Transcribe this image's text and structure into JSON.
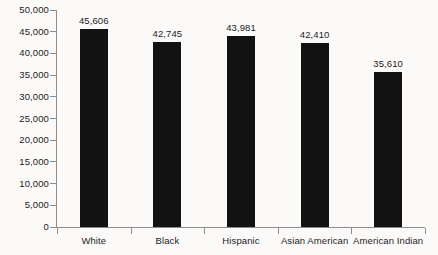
{
  "chart_data": {
    "type": "bar",
    "title": "",
    "subtitle": "",
    "xlabel": "",
    "ylabel": "",
    "categories": [
      "White",
      "Black",
      "Hispanic",
      "Asian American",
      "American Indian"
    ],
    "values": [
      45606,
      42745,
      43981,
      42410,
      35610
    ],
    "value_labels": [
      "45,606",
      "42,745",
      "43,981",
      "42,410",
      "35,610"
    ],
    "ylim": [
      0,
      50000
    ],
    "ytick_values": [
      0,
      5000,
      10000,
      15000,
      20000,
      25000,
      30000,
      35000,
      40000,
      45000,
      50000
    ],
    "ytick_labels": [
      "0",
      "5,000",
      "10,000",
      "15,000",
      "20,000",
      "25,000",
      "30,000",
      "35,000",
      "40,000",
      "45,000",
      "50,000"
    ],
    "grid": false,
    "legend": null,
    "legend_position": "none",
    "annotations": [],
    "colors": {
      "bar": "#121212",
      "axis": "#8d8d8d",
      "text": "#1b1b1b",
      "background": "#fbfaf9"
    }
  }
}
